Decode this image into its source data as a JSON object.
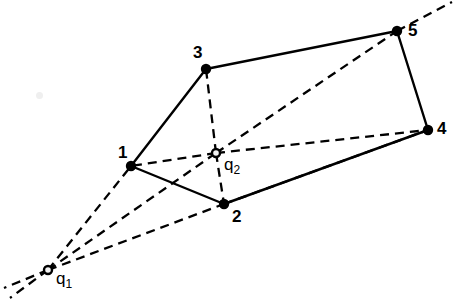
{
  "figure": {
    "width": 454,
    "height": 305,
    "background_color": "#ffffff",
    "stroke_color": "#000000"
  },
  "chart_data": {
    "type": "scatter",
    "title": "",
    "xlabel": "",
    "ylabel": "",
    "xlim": [
      0,
      454
    ],
    "ylim": [
      0,
      305
    ],
    "grid": false,
    "legend": "none",
    "coordinate_system": "screen-pixels-origin-top-left",
    "vertices": [
      {
        "label": "1",
        "x": 131,
        "y": 166,
        "marker": "filled-dot",
        "label_x": 118,
        "label_y": 144
      },
      {
        "label": "2",
        "x": 224,
        "y": 204,
        "marker": "filled-dot",
        "label_x": 232,
        "label_y": 208
      },
      {
        "label": "3",
        "x": 206,
        "y": 69,
        "marker": "filled-dot",
        "label_x": 193,
        "label_y": 44
      },
      {
        "label": "4",
        "x": 428,
        "y": 130,
        "marker": "filled-dot",
        "label_x": 437,
        "label_y": 120
      },
      {
        "label": "5",
        "x": 397,
        "y": 31,
        "marker": "filled-dot",
        "label_x": 408,
        "label_y": 22
      }
    ],
    "query_points": [
      {
        "label": "q1",
        "display": "q",
        "subscript": "1",
        "x": 48,
        "y": 270,
        "marker": "open-dot",
        "label_x": 56,
        "label_y": 270
      },
      {
        "label": "q2",
        "display": "q",
        "subscript": "2",
        "x": 216,
        "y": 153,
        "marker": "open-dot",
        "label_x": 224,
        "label_y": 156
      }
    ],
    "solid_edges": [
      {
        "from": "1",
        "to": "3"
      },
      {
        "from": "3",
        "to": "5"
      },
      {
        "from": "5",
        "to": "4"
      },
      {
        "from": "4",
        "to": "2"
      },
      {
        "from": "2",
        "to": "1"
      }
    ],
    "dashed_edges": [
      {
        "from": "q1",
        "to": "1"
      },
      {
        "from": "q1",
        "to": "q2"
      },
      {
        "from": "q1",
        "to": "2"
      },
      {
        "from": "2",
        "to": "4"
      },
      {
        "from": "q2",
        "to": "1"
      },
      {
        "from": "q2",
        "to": "2"
      },
      {
        "from": "q2",
        "to": "3"
      },
      {
        "from": "q2",
        "to": "4"
      },
      {
        "from": "q2",
        "to": "5"
      }
    ],
    "dashed_rays": [
      {
        "name": "ray-q2-through-5",
        "from_x": 397,
        "from_y": 31,
        "to_x": 452,
        "to_y": 2
      },
      {
        "name": "ray-q1-down-left-a",
        "from_x": 48,
        "from_y": 270,
        "to_x": 4,
        "to_y": 288
      },
      {
        "name": "ray-q1-down-left-b",
        "from_x": 48,
        "from_y": 270,
        "to_x": 10,
        "to_y": 298
      }
    ]
  },
  "labels": {
    "v1": "1",
    "v2": "2",
    "v3": "3",
    "v4": "4",
    "v5": "5",
    "q1_base": "q",
    "q1_sub": "1",
    "q2_base": "q",
    "q2_sub": "2"
  }
}
